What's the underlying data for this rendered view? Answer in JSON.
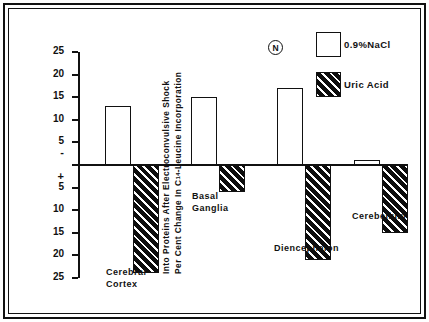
{
  "figure": {
    "marker_label": "N"
  },
  "axis": {
    "title_line1": "Per Cent Change In C",
    "title_line1_sup": "14",
    "title_line1_tail": "-Leucine Incorporation",
    "title_line2": "Into Proteins After Electroconvulsive Shock",
    "ticks_positive": [
      "25",
      "20",
      "15",
      "10",
      "5"
    ],
    "sign_positive": "+",
    "sign_negative": "-",
    "ticks_negative": [
      "5",
      "10",
      "15",
      "20",
      "25"
    ]
  },
  "legend": {
    "items": [
      {
        "label": "0.9%NaCl",
        "swatch": "open-square"
      },
      {
        "label": "Uric Acid",
        "swatch": "hatched-square"
      }
    ]
  },
  "chart_data": {
    "type": "bar",
    "title": "",
    "xlabel": "",
    "ylabel": "Per Cent Change In C14-Leucine Incorporation Into Proteins After Electroconvulsive Shock",
    "ylim": [
      -25,
      25
    ],
    "ytick_values": [
      25,
      20,
      15,
      10,
      5,
      0,
      -5,
      -10,
      -15,
      -20,
      -25
    ],
    "ytick_labels": [
      "25",
      "20",
      "15",
      "10",
      "5",
      "",
      "5",
      "10",
      "15",
      "20",
      "25"
    ],
    "grid": false,
    "legend_position": "top-right",
    "categories": [
      "Cerebral Cortex",
      "Basal Ganglia",
      "Diencephalon",
      "Cerebellum"
    ],
    "category_label_lines": [
      [
        "Cerebral",
        "Cortex"
      ],
      [
        "Basal",
        "Ganglia"
      ],
      [
        "Diencephalon"
      ],
      [
        "Cerebellum"
      ]
    ],
    "series": [
      {
        "name": "0.9%NaCl",
        "values": [
          13,
          15,
          17,
          1
        ]
      },
      {
        "name": "Uric Acid",
        "values": [
          -24,
          -6,
          -21,
          -15
        ]
      }
    ]
  }
}
